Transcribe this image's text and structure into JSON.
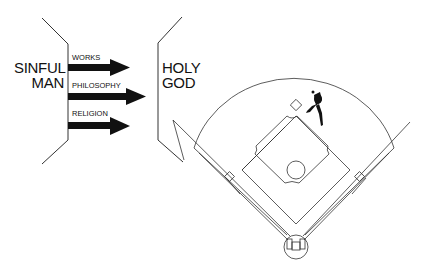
{
  "left_label": {
    "line1": "SINFUL",
    "line2": "MAN"
  },
  "right_label": {
    "line1": "HOLY",
    "line2": "GOD"
  },
  "arrows": [
    {
      "label": "WORKS"
    },
    {
      "label": "PHILOSOPHY"
    },
    {
      "label": "RELIGION"
    }
  ],
  "colors": {
    "ink": "#111111",
    "background": "#ffffff"
  }
}
